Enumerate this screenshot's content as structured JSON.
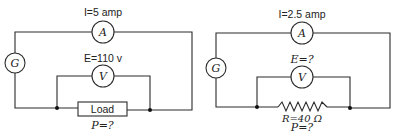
{
  "left_circuit": {
    "current_label": "I=5 amp",
    "voltage_label": "E=110 v",
    "generator_symbol": "G",
    "ammeter_symbol": "A",
    "voltmeter_symbol": "V",
    "load_label": "Load",
    "power_label": "P=?"
  },
  "right_circuit": {
    "current_label": "I=2.5 amp",
    "voltage_label": "E=?",
    "generator_symbol": "G",
    "ammeter_symbol": "A",
    "voltmeter_symbol": "V",
    "resistance_label": "R=40 Ω",
    "power_label": "P=?"
  },
  "colors": {
    "line": "#2a2a2a",
    "background": "#ffffff"
  }
}
